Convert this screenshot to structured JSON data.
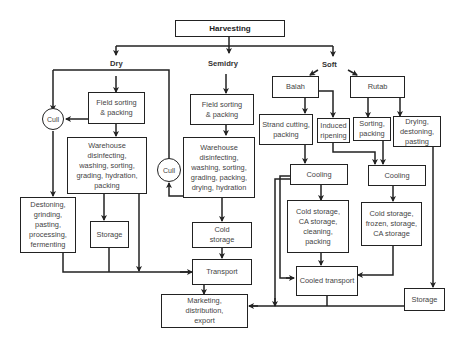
{
  "diagram": {
    "root": "Harvesting",
    "branches": {
      "dry": "Dry",
      "semidry": "Semidry",
      "soft": "Soft"
    },
    "nodes": {
      "dry_field_sorting": "Field sorting\n& packing",
      "dry_cull": "Cull",
      "dry_warehouse": "Warehouse\ndisinfecting,\nwashing, sorting,\ngrading, hydration,\npacking",
      "dry_destoning": "Destoning,\ngrinding,\npasting,\nprocessing,\nfermenting",
      "dry_storage": "Storage",
      "semi_field_sorting": "Field sorting\n& packing",
      "semi_cull": "Cull",
      "semi_warehouse": "Warehouse\ndisinfecting,\nwashing, sorting,\ngrading, packing,\ndrying, hydration",
      "semi_cold_storage": "Cold\nstorage",
      "transport": "Transport",
      "marketing": "Marketing,\ndistribution,\nexport",
      "balah": "Balah",
      "rutab": "Rutab",
      "strand_cutting": "Strand cutting,\npacking",
      "induced_ripening": "Induced\nripening",
      "rutab_sorting": "Sorting,\npacking",
      "rutab_drying": "Drying,\ndestoning,\npasting",
      "balah_cooling": "Cooling",
      "rutab_cooling": "Cooling",
      "balah_cold_storage": "Cold storage,\nCA storage,\ncleaning,\npacking",
      "rutab_cold_storage": "Cold storage,\nfrozen, storage,\nCA storage",
      "cooled_transport": "Cooled transport",
      "rutab_storage": "Storage"
    },
    "edges": [
      [
        "Harvesting",
        "Dry"
      ],
      [
        "Harvesting",
        "Semidry"
      ],
      [
        "Harvesting",
        "Soft"
      ],
      [
        "Dry",
        "Field sorting & packing (dry)"
      ],
      [
        "Field sorting & packing (dry)",
        "Cull (dry)"
      ],
      [
        "Field sorting & packing (dry)",
        "Warehouse (dry)"
      ],
      [
        "Cull (dry)",
        "Destoning, grinding..."
      ],
      [
        "Warehouse (dry)",
        "Storage (dry)"
      ],
      [
        "Warehouse (dry)",
        "Transport"
      ],
      [
        "Destoning, grinding...",
        "Transport"
      ],
      [
        "Storage (dry)",
        "Transport"
      ],
      [
        "Semidry",
        "Field sorting & packing (semidry)"
      ],
      [
        "Field sorting & packing (semidry)",
        "Warehouse (semidry)"
      ],
      [
        "Warehouse (semidry)",
        "Cull (semidry)"
      ],
      [
        "Cull (semidry)",
        "Cull (dry)"
      ],
      [
        "Warehouse (semidry)",
        "Cold storage"
      ],
      [
        "Cold storage",
        "Transport"
      ],
      [
        "Transport",
        "Marketing, distribution, export"
      ],
      [
        "Soft",
        "Balah"
      ],
      [
        "Soft",
        "Rutab"
      ],
      [
        "Balah",
        "Strand cutting, packing"
      ],
      [
        "Balah",
        "Induced ripening"
      ],
      [
        "Rutab",
        "Sorting, packing"
      ],
      [
        "Rutab",
        "Drying, destoning, pasting"
      ],
      [
        "Strand cutting, packing",
        "Cooling (balah)"
      ],
      [
        "Induced ripening",
        "Cooling (rutab)"
      ],
      [
        "Sorting, packing",
        "Cooling (rutab)"
      ],
      [
        "Cooling (balah)",
        "Cold storage, CA storage, cleaning, packing"
      ],
      [
        "Cooling (balah)",
        "Cooled transport"
      ],
      [
        "Cooling (balah)",
        "Marketing, distribution, export"
      ],
      [
        "Cooling (rutab)",
        "Cold storage, frozen, storage, CA storage"
      ],
      [
        "Cold storage, CA storage, cleaning, packing",
        "Cooled transport"
      ],
      [
        "Cold storage, frozen, storage, CA storage",
        "Cooled transport"
      ],
      [
        "Drying, destoning, pasting",
        "Storage (rutab)"
      ],
      [
        "Cooled transport",
        "Marketing, distribution, export"
      ],
      [
        "Storage (rutab)",
        "Marketing, distribution, export"
      ]
    ]
  }
}
